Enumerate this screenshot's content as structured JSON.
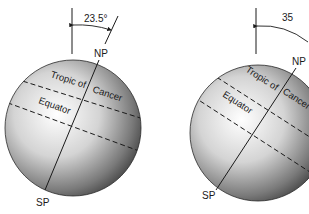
{
  "figures": [
    {
      "id": "left",
      "tilt_label": "23.5°",
      "north_pole_label": "NP",
      "south_pole_label": "SP",
      "tropic_label_part1": "Tropic of",
      "tropic_label_part2": "Cancer",
      "equator_label": "Equator"
    },
    {
      "id": "right",
      "tilt_label": "35",
      "north_pole_label": "NP",
      "south_pole_label": "SP",
      "tropic_label_part1": "Tropic of",
      "tropic_label_part2": "Cancer",
      "equator_label": "Equator"
    }
  ],
  "colors": {
    "line": "#1a1a1a",
    "globe_light": "#ffffff",
    "globe_dark": "#3a3a3a"
  }
}
